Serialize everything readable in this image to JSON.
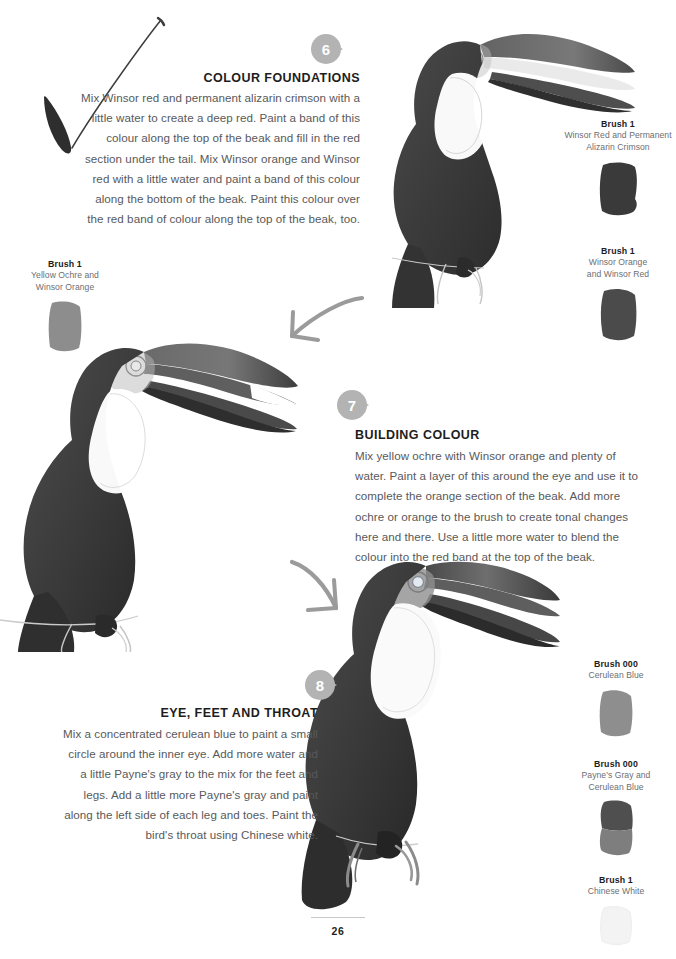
{
  "page": {
    "number": "26",
    "background_color": "#ffffff",
    "text_color": "#58595b",
    "heading_color": "#1d1d1d",
    "badge_color": "#b3b3b3",
    "sketch_color": "#9b9b9b"
  },
  "steps": [
    {
      "number": "6",
      "heading": "COLOUR FOUNDATIONS",
      "body": "Mix Winsor red and permanent alizarin crimson with a little water to create a deep red. Paint a band of this colour along the top of the beak and fill in the red section under the tail. Mix Winsor orange and Winsor red with a little water and paint a band of this colour along the bottom of the beak. Paint this colour over the red band of colour along the top of the beak, too."
    },
    {
      "number": "7",
      "heading": "BUILDING COLOUR",
      "body": "Mix yellow ochre with Winsor orange and plenty of water. Paint a layer of this around the eye and use it to complete the orange section of the beak. Add more ochre or orange to the brush to create tonal changes here and there. Use a little more water to blend the colour into the red band at the top of the beak."
    },
    {
      "number": "8",
      "heading": "EYE, FEET AND THROAT",
      "body": "Mix a concentrated cerulean blue to paint a small circle around the inner eye. Add more water and a little Payne's gray to the mix for the feet and legs. Add a little more Payne's gray and paint along the left side of each leg and toes. Paint the bird's throat using Chinese white."
    }
  ],
  "swatches": [
    {
      "id": "swatch-yellow-ochre-winsor-orange",
      "title": "Brush 1",
      "subtitle": "Yellow Ochre and\nWinsor Orange",
      "sub_line_1": "Yellow Ochre and",
      "sub_line_2": "Winsor Orange",
      "chip_color": "#8d8d8d"
    },
    {
      "id": "swatch-winsor-red-alizarin-crimson",
      "title": "Brush 1",
      "sub_line_1": "Winsor Red and Permanent",
      "sub_line_2": "Alizarin Crimson",
      "chip_color": "#3a3a3a"
    },
    {
      "id": "swatch-winsor-orange-winsor-red",
      "title": "Brush 1",
      "sub_line_1": "Winsor Orange",
      "sub_line_2": "and Winsor Red",
      "chip_color": "#4b4b4b"
    },
    {
      "id": "swatch-cerulean-blue",
      "title": "Brush 000",
      "sub_line_1": "Cerulean Blue",
      "sub_line_2": "",
      "chip_color": "#8e8e8e"
    },
    {
      "id": "swatch-paynes-gray-cerulean-blue",
      "title": "Brush 000",
      "sub_line_1": "Payne's Gray and",
      "sub_line_2": "Cerulean Blue",
      "chip_color": "#6a6a6a"
    },
    {
      "id": "swatch-chinese-white",
      "title": "Brush 1",
      "sub_line_1": "Chinese White",
      "sub_line_2": "",
      "chip_color": "#f2f2f2"
    }
  ],
  "illustrations": [
    {
      "id": "toucan-step-6",
      "caption": "Toucan watercolour study, colour foundations stage"
    },
    {
      "id": "toucan-step-7",
      "caption": "Toucan watercolour study, building colour stage"
    },
    {
      "id": "toucan-step-8",
      "caption": "Toucan watercolour study, eye feet and throat stage"
    }
  ],
  "sketch_marks": [
    {
      "id": "brush-stroke-mark",
      "description": "hand-drawn V brush stroke"
    },
    {
      "id": "arrow-step-6-to-7",
      "description": "curved arrow pointing down-left"
    },
    {
      "id": "arrow-step-7-to-8",
      "description": "curved arrow pointing down-right"
    }
  ]
}
